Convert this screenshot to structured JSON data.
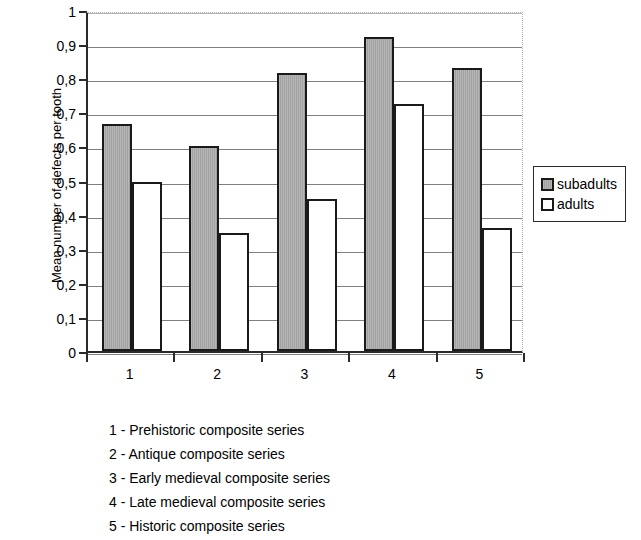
{
  "chart_data": {
    "type": "bar",
    "title": "",
    "xlabel": "",
    "ylabel": "Mean number of defects per tooth",
    "categories": [
      "1",
      "2",
      "3",
      "4",
      "5"
    ],
    "series": [
      {
        "name": "subadults",
        "color": "#a9a9a9",
        "values": [
          0.665,
          0.6,
          0.815,
          0.92,
          0.83
        ]
      },
      {
        "name": "adults",
        "color": "#ffffff",
        "values": [
          0.495,
          0.345,
          0.445,
          0.725,
          0.36
        ]
      }
    ],
    "ylim": [
      0,
      1
    ],
    "y_ticks": [
      0,
      0.1,
      0.2,
      0.3,
      0.4,
      0.5,
      0.6,
      0.7,
      0.8,
      0.9,
      1
    ],
    "y_tick_labels": [
      "0",
      "0,1",
      "0,2",
      "0,3",
      "0,4",
      "0,5",
      "0,6",
      "0,7",
      "0,8",
      "0,9",
      "1"
    ],
    "grid": true,
    "grid_axis": "y",
    "legend_position": "right",
    "decimal_separator": ","
  },
  "legend": {
    "items": [
      {
        "label": "subadults",
        "swatch": "gray-filled-square"
      },
      {
        "label": "adults",
        "swatch": "white-filled-square"
      }
    ]
  },
  "caption": {
    "lines": [
      "1 - Prehistoric composite series",
      "2 - Antique composite series",
      "3 - Early  medieval composite series",
      "4 - Late medieval composite series",
      "5 - Historic composite series"
    ]
  }
}
